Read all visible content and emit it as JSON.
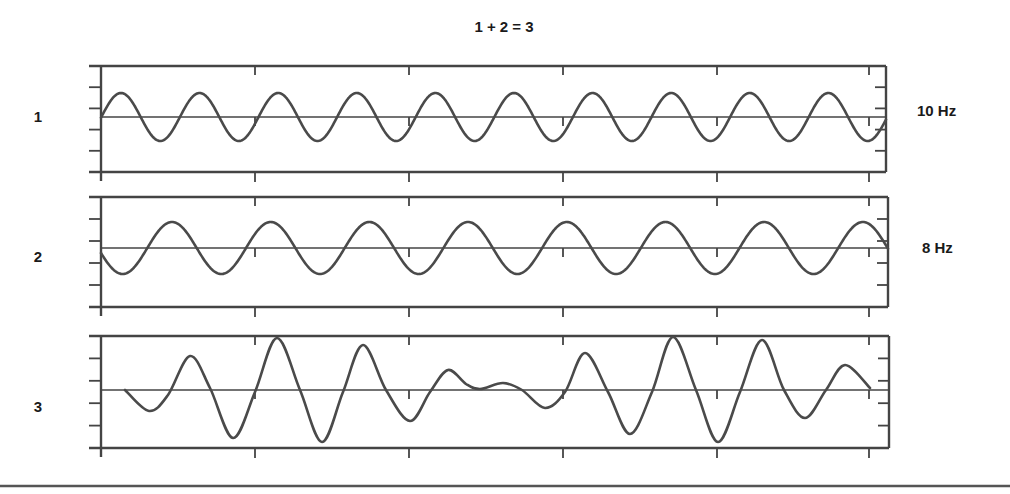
{
  "figure": {
    "title": "1 + 2 = 3",
    "bottom_rule": true
  },
  "panels": [
    {
      "id": "1",
      "label": "1",
      "freq_label": "10 Hz"
    },
    {
      "id": "2",
      "label": "2",
      "freq_label": "8 Hz"
    },
    {
      "id": "3",
      "label": "3",
      "freq_label": ""
    }
  ],
  "chart_data": [
    {
      "type": "line",
      "title": "1 + 2 = 3",
      "panel": "1",
      "series": [
        {
          "name": "1",
          "frequency_hz": 10,
          "waveform": "sine",
          "cycles_visible": 10
        }
      ],
      "annotation": "10 Hz",
      "x_ticks": 6,
      "y_ticks": 4,
      "grid": false,
      "geometry": {
        "x0": 101,
        "x1": 886,
        "top": 66,
        "bottom": 172,
        "baseline": 117,
        "amplitude": 24,
        "first_peak_x": 121,
        "period_px": 78.6
      }
    },
    {
      "type": "line",
      "panel": "2",
      "series": [
        {
          "name": "2",
          "frequency_hz": 8,
          "waveform": "sine",
          "cycles_visible": 8
        }
      ],
      "annotation": "8 Hz",
      "x_ticks": 6,
      "y_ticks": 4,
      "grid": false,
      "geometry": {
        "x0": 101,
        "x1": 888,
        "top": 197,
        "bottom": 307,
        "baseline": 248,
        "amplitude": 26,
        "first_peak_x": 172,
        "period_px": 98.7
      }
    },
    {
      "type": "line",
      "panel": "3",
      "series": [
        {
          "name": "3 (sum of 1 and 2)",
          "description": "beat pattern, 2 Hz envelope",
          "points": [
            [
              125,
              390
            ],
            [
              149,
              411
            ],
            [
              168,
              395
            ],
            [
              190,
              356
            ],
            [
              210,
              388
            ],
            [
              233,
              438
            ],
            [
              255,
              392
            ],
            [
              277,
              338
            ],
            [
              300,
              390
            ],
            [
              322,
              442
            ],
            [
              343,
              392
            ],
            [
              363,
              345
            ],
            [
              386,
              390
            ],
            [
              410,
              421
            ],
            [
              430,
              392
            ],
            [
              448,
              370
            ],
            [
              466,
              384
            ],
            [
              480,
              389
            ],
            [
              503,
              383
            ],
            [
              522,
              390
            ],
            [
              545,
              408
            ],
            [
              565,
              392
            ],
            [
              585,
              353
            ],
            [
              608,
              392
            ],
            [
              630,
              434
            ],
            [
              652,
              392
            ],
            [
              673,
              337
            ],
            [
              696,
              390
            ],
            [
              718,
              442
            ],
            [
              740,
              392
            ],
            [
              762,
              340
            ],
            [
              784,
              390
            ],
            [
              805,
              418
            ],
            [
              826,
              390
            ],
            [
              845,
              365
            ],
            [
              870,
              388
            ]
          ]
        }
      ],
      "annotation": "",
      "x_ticks": 6,
      "y_ticks": 4,
      "grid": false,
      "geometry": {
        "x0": 101,
        "x1": 889,
        "top": 336,
        "bottom": 448,
        "baseline": 390
      }
    }
  ]
}
